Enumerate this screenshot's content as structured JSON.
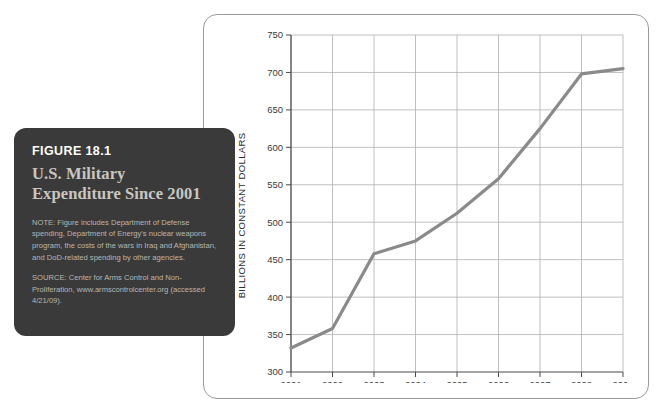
{
  "caption": {
    "figure_number": "FIGURE 18.1",
    "title": "U.S. Military Expenditure Since 2001",
    "note": "NOTE: Figure includes Department of Defense spending, Department of Energy's nuclear weapons program, the costs of the wars in Iraq and Afghanistan, and DoD-related spending by other agencies.",
    "source": "SOURCE: Center for Arms Control and Non-Proliferation, www.armscontrolcenter.org (accessed 4/21/09).",
    "card_bg": "#3a3a3a",
    "title_color": "#c9c6c0"
  },
  "chart_data": {
    "type": "line",
    "title": "U.S. Military Expenditure Since 2001",
    "xlabel": "",
    "ylabel": "BILLIONS IN CONSTANT DOLLARS",
    "x": [
      2001,
      2002,
      2003,
      2004,
      2005,
      2006,
      2007,
      2008,
      2009
    ],
    "categories": [
      "2001",
      "2002",
      "2003",
      "2004",
      "2005",
      "2006",
      "2007",
      "2008",
      "2009"
    ],
    "values": [
      332,
      358,
      458,
      475,
      512,
      558,
      625,
      698,
      705
    ],
    "series": [
      {
        "name": "U.S. Military Expenditure",
        "values": [
          332,
          358,
          458,
          475,
          512,
          558,
          625,
          698,
          705
        ]
      }
    ],
    "ylim": [
      300,
      750
    ],
    "yticks": [
      300,
      350,
      400,
      450,
      500,
      550,
      600,
      650,
      700,
      750
    ],
    "ytick_labels": [
      "300",
      "350",
      "400",
      "450",
      "500",
      "550",
      "600",
      "650",
      "700",
      "750"
    ],
    "xlim": [
      2001,
      2009
    ],
    "xticks": [
      2001,
      2002,
      2003,
      2004,
      2005,
      2006,
      2007,
      2008,
      2009
    ],
    "xtick_labels": [
      "2001",
      "2002",
      "2003",
      "2004",
      "2005",
      "2006",
      "2007",
      "2008",
      "2009"
    ],
    "grid": true,
    "legend": false,
    "line_color": "#8a8a8a",
    "grid_color": "#b0b0b0",
    "axis_color": "#4a4a4a"
  }
}
